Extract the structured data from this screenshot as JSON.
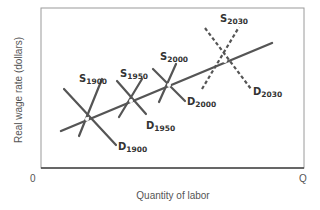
{
  "chart_data": {
    "type": "line",
    "title": "",
    "xlabel": "Quantity of labor",
    "ylabel": "Real wage rate (dollars)",
    "x_origin_label": "0",
    "x_end_label": "Q",
    "grid": false,
    "legend": "none (curves labeled directly)",
    "series": [
      {
        "name": "S1900",
        "kind": "supply",
        "style": "solid",
        "points": [
          [
            79,
            136
          ],
          [
            102,
            79
          ]
        ]
      },
      {
        "name": "D1900",
        "kind": "demand",
        "style": "solid",
        "points": [
          [
            64,
            89
          ],
          [
            116,
            145
          ]
        ]
      },
      {
        "name": "S1950",
        "kind": "supply",
        "style": "solid",
        "points": [
          [
            119,
            117
          ],
          [
            142,
            79
          ]
        ]
      },
      {
        "name": "D1950",
        "kind": "demand",
        "style": "solid",
        "points": [
          [
            117,
            81
          ],
          [
            146,
            114
          ]
        ]
      },
      {
        "name": "S2000",
        "kind": "supply",
        "style": "solid",
        "points": [
          [
            159,
            102
          ],
          [
            176,
            64
          ]
        ]
      },
      {
        "name": "D2000",
        "kind": "demand",
        "style": "solid",
        "points": [
          [
            153,
            69
          ],
          [
            185,
            101
          ]
        ]
      },
      {
        "name": "S2030",
        "kind": "supply",
        "style": "dashed",
        "points": [
          [
            202,
            89
          ],
          [
            239,
            27
          ]
        ]
      },
      {
        "name": "D2030",
        "kind": "demand",
        "style": "dashed",
        "points": [
          [
            205,
            28
          ],
          [
            251,
            89
          ]
        ]
      },
      {
        "name": "Trend",
        "kind": "equilibrium-path",
        "style": "solid",
        "points": [
          [
            61,
            131
          ],
          [
            272,
            43
          ]
        ]
      }
    ],
    "equilibria": [
      {
        "year": "1900",
        "x": 87,
        "y": 119
      },
      {
        "year": "1950",
        "x": 131,
        "y": 101
      },
      {
        "year": "2000",
        "x": 169,
        "y": 85
      },
      {
        "year": "2030",
        "x": 225,
        "y": 61
      }
    ]
  },
  "labels": {
    "s1900": {
      "main": "S",
      "sub": "1900"
    },
    "d1900": {
      "main": "D",
      "sub": "1900"
    },
    "s1950": {
      "main": "S",
      "sub": "1950"
    },
    "d1950": {
      "main": "D",
      "sub": "1950"
    },
    "s2000": {
      "main": "S",
      "sub": "2000"
    },
    "d2000": {
      "main": "D",
      "sub": "2000"
    },
    "s2030": {
      "main": "S",
      "sub": "2030"
    },
    "d2030": {
      "main": "D",
      "sub": "2030"
    }
  },
  "colors": {
    "curve": "#555555",
    "frame": "#888888",
    "axis": "#444444",
    "text": "#333333"
  }
}
